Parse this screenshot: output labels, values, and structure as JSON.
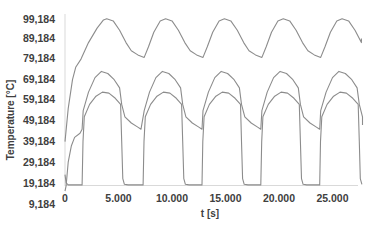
{
  "chart_data": {
    "type": "line",
    "title": "",
    "xlabel": "t [s]",
    "ylabel": "Temperature [°C]",
    "xlim": [
      0,
      27800
    ],
    "ylim": [
      9.184,
      99.184
    ],
    "grid": false,
    "legend": null,
    "x_ticks": [
      "0",
      "5.000",
      "10.000",
      "15.000",
      "20.000",
      "25.000"
    ],
    "x_tick_values": [
      0,
      5000,
      10000,
      15000,
      20000,
      25000
    ],
    "y_ticks": [
      "99,184",
      "89,184",
      "79,184",
      "69,184",
      "59,184",
      "49,184",
      "39,184",
      "29,184",
      "19,184",
      "9,184"
    ],
    "y_tick_values": [
      99.184,
      89.184,
      79.184,
      69.184,
      59.184,
      49.184,
      39.184,
      29.184,
      19.184,
      9.184
    ],
    "series_color": "#8c8c8c",
    "series": [
      {
        "name": "upper",
        "x": [
          0,
          300,
          700,
          1000,
          1500,
          2200,
          3000,
          3600,
          4200,
          4800,
          5400,
          6000,
          6600,
          7200,
          7800,
          8600,
          9400,
          10000,
          10600,
          11200,
          11800,
          12400,
          13000,
          13600,
          14400,
          15200,
          15800,
          16400,
          17000,
          17600,
          18200,
          18800,
          19400,
          20200,
          21000,
          21600,
          22200,
          22800,
          23400,
          24000,
          24600,
          25400,
          26200,
          26800,
          27400,
          27800
        ],
        "y": [
          40,
          55,
          70,
          76,
          80,
          88,
          95,
          99,
          99.5,
          98,
          93,
          87,
          83,
          81.5,
          80.5,
          91,
          98,
          99.5,
          98,
          93,
          87,
          83,
          81.5,
          80.5,
          91,
          98,
          99.5,
          98,
          93,
          87,
          83,
          81.5,
          80.5,
          91,
          98,
          99.5,
          98,
          93,
          87,
          83,
          81.5,
          80.5,
          91,
          98,
          99.5,
          90
        ]
      },
      {
        "name": "middle",
        "x": [
          0,
          400,
          800,
          1200,
          1600,
          2000,
          2600,
          3200,
          3800,
          4400,
          5000,
          5300,
          5800,
          6400,
          7000,
          7400,
          7900,
          8500,
          9100,
          9700,
          10300,
          10700,
          11000,
          11500,
          12100,
          12700,
          13100,
          13600,
          14200,
          14800,
          15400,
          16000,
          16400,
          16700,
          17200,
          17800,
          18400,
          18800,
          19300,
          19900,
          20500,
          21100,
          21700,
          22100,
          22400,
          22900,
          23500,
          24100,
          24500,
          25000,
          25600,
          26200,
          26800,
          27400,
          27800
        ],
        "y": [
          15,
          17,
          18.5,
          19,
          25,
          45,
          62,
          71,
          74,
          73,
          68,
          62,
          54,
          50,
          48,
          46,
          52,
          65,
          72,
          74,
          72,
          66,
          58,
          51,
          48,
          46,
          52,
          65,
          72,
          74,
          72,
          66,
          58,
          51,
          48,
          46,
          52,
          65,
          72,
          74,
          72,
          66,
          58,
          51,
          48,
          46,
          52,
          65,
          72,
          74,
          72,
          66,
          58,
          51,
          48
        ]
      },
      {
        "name": "lower",
        "x": [
          0,
          100,
          300,
          900,
          1500,
          1600,
          1900,
          2400,
          3000,
          3600,
          4200,
          4800,
          5200,
          5400,
          5600,
          5900,
          6500,
          7300,
          7400,
          7700,
          8200,
          8800,
          9400,
          10000,
          10600,
          10900,
          11100,
          11400,
          12100,
          12800,
          12900,
          13200,
          13700,
          14300,
          14900,
          15500,
          16100,
          16400,
          16600,
          16900,
          17600,
          18300,
          18400,
          18700,
          19200,
          19800,
          20400,
          21000,
          21600,
          21900,
          22100,
          22400,
          23100,
          23800,
          23900,
          24200,
          24700,
          25300,
          25900,
          26500,
          27100,
          27400,
          27600,
          27800
        ],
        "y": [
          19,
          19,
          35,
          42,
          44,
          19,
          19,
          19,
          19,
          19,
          19,
          19,
          19,
          19,
          19,
          19,
          19,
          19,
          19,
          19,
          19,
          19,
          19,
          19,
          19,
          19,
          19,
          19,
          19,
          19,
          19,
          19,
          19,
          19,
          19,
          19,
          19,
          19,
          19,
          19,
          19,
          19,
          19,
          19,
          19,
          19,
          19,
          19,
          19,
          19,
          19,
          19,
          19,
          19,
          19,
          19,
          19,
          19,
          19,
          19,
          19,
          19,
          19,
          19
        ],
        "note": "Square-wave-like cycles: rises from ~19 to peak ~64 at each cycle start (t≈1600, 7300, 12800, 18300, 23800), peaks ~64 near mid-cycle, drops sharply to ~19 at t≈5400, 10900, 16400, 21900, 27400"
      }
    ]
  }
}
